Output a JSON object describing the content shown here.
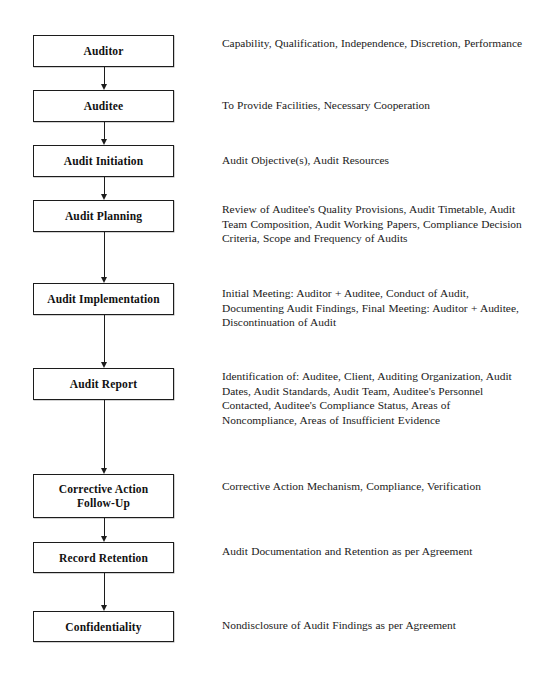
{
  "diagram": {
    "orientation": "vertical-top-down",
    "background_color": "#ffffff",
    "line_color": "#1c1c1c",
    "text_color": "#1a1a1a",
    "stages": [
      {
        "id": "auditor",
        "label": "Auditor",
        "description": "Capability, Qualification, Independence, Discretion, Performance",
        "box_top": 35,
        "box_height": 32,
        "desc_top": 36
      },
      {
        "id": "auditee",
        "label": "Auditee",
        "description": "To Provide Facilities, Necessary Cooperation",
        "box_top": 90,
        "box_height": 32,
        "desc_top": 98
      },
      {
        "id": "audit-initiation",
        "label": "Audit Initiation",
        "description": "Audit Objective(s), Audit Resources",
        "box_top": 145,
        "box_height": 32,
        "desc_top": 153
      },
      {
        "id": "audit-planning",
        "label": "Audit Planning",
        "description": "Review of Auditee's Quality Provisions, Audit Timetable, Audit Team Composition, Audit Working Papers, Compliance Decision Criteria, Scope and Frequency of Audits",
        "box_top": 200,
        "box_height": 32,
        "desc_top": 202
      },
      {
        "id": "audit-implementation",
        "label": "Audit Implementation",
        "description": "Initial Meeting:  Auditor + Auditee, Conduct of Audit, Documenting Audit Findings, Final Meeting: Auditor + Auditee, Discontinuation of Audit",
        "box_top": 283,
        "box_height": 32,
        "desc_top": 286
      },
      {
        "id": "audit-report",
        "label": "Audit Report",
        "description": "Identification of:  Auditee, Client, Auditing Organization, Audit Dates, Audit Standards, Audit Team, Auditee's Personnel Contacted, Auditee's Compliance Status, Areas of Noncompliance, Areas of Insufficient Evidence",
        "box_top": 368,
        "box_height": 32,
        "desc_top": 369
      },
      {
        "id": "corrective-action-follow-up",
        "label": "Corrective Action\nFollow-Up",
        "description": "Corrective Action Mechanism, Compliance, Verification",
        "box_top": 474,
        "box_height": 44,
        "desc_top": 479
      },
      {
        "id": "record-retention",
        "label": "Record Retention",
        "description": "Audit Documentation and Retention as per Agreement",
        "box_top": 542,
        "box_height": 31,
        "desc_top": 544
      },
      {
        "id": "confidentiality",
        "label": "Confidentiality",
        "description": "Nondisclosure of Audit Findings as per Agreement",
        "box_top": 611,
        "box_height": 31,
        "desc_top": 618
      }
    ],
    "connectors": [
      {
        "id": "auditor-to-auditee",
        "from": "auditor",
        "to": "auditee",
        "top": 67,
        "height": 23
      },
      {
        "id": "auditee-to-audit-initiation",
        "from": "auditee",
        "to": "audit-initiation",
        "top": 122,
        "height": 23
      },
      {
        "id": "audit-initiation-to-audit-planning",
        "from": "audit-initiation",
        "to": "audit-planning",
        "top": 177,
        "height": 23
      },
      {
        "id": "audit-planning-to-audit-implementation",
        "from": "audit-planning",
        "to": "audit-implementation",
        "top": 232,
        "height": 51
      },
      {
        "id": "audit-implementation-to-audit-report",
        "from": "audit-implementation",
        "to": "audit-report",
        "top": 315,
        "height": 53
      },
      {
        "id": "audit-report-to-corrective-action",
        "from": "audit-report",
        "to": "corrective-action-follow-up",
        "top": 400,
        "height": 74
      },
      {
        "id": "corrective-action-to-record-retention",
        "from": "corrective-action-follow-up",
        "to": "record-retention",
        "top": 518,
        "height": 24
      },
      {
        "id": "record-retention-to-confidentiality",
        "from": "record-retention",
        "to": "confidentiality",
        "top": 573,
        "height": 38
      }
    ]
  }
}
